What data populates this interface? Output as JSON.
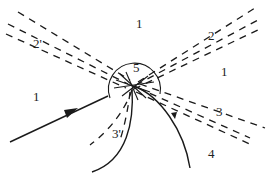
{
  "diagram": {
    "type": "wave-interaction-schematic",
    "center_label": "5",
    "labels": {
      "region_top": "1",
      "region_left": "1",
      "region_right": "1",
      "wave_upper_left": "2'",
      "wave_upper_right": "2",
      "wave_lower_right": "3",
      "wave_lower_left": "3'",
      "region_bottom_right": "4",
      "center": "5"
    },
    "colors": {
      "stroke": "#1a1a1a",
      "background": "#ffffff",
      "text": "#222222"
    },
    "elements": [
      {
        "id": "incident-ray",
        "style": "solid",
        "arrow": true
      },
      {
        "id": "band-2-prime",
        "style": "dashed",
        "direction": "upper-left"
      },
      {
        "id": "band-2",
        "style": "dashed",
        "direction": "upper-right"
      },
      {
        "id": "band-3",
        "style": "dashed",
        "direction": "lower-right"
      },
      {
        "id": "band-3-prime",
        "style": "dashed",
        "direction": "lower-left"
      },
      {
        "id": "curve-left",
        "style": "solid"
      },
      {
        "id": "curve-right",
        "style": "solid"
      },
      {
        "id": "focus-circle",
        "style": "solid"
      }
    ]
  }
}
